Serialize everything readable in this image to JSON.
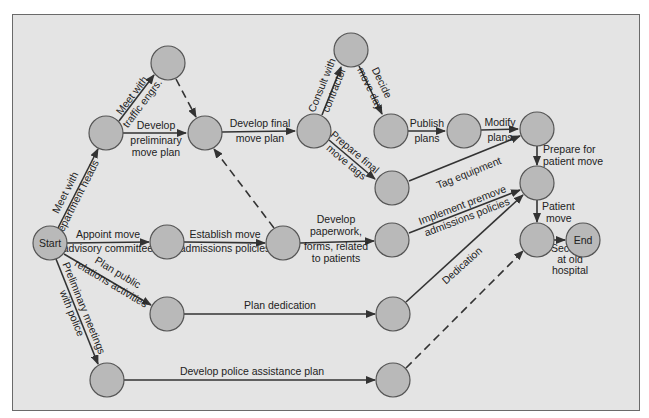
{
  "diagram": {
    "type": "activity-on-arrow network (PERT)",
    "colors": {
      "background": "#e4e4e4",
      "node_fill": "#b9b9b9",
      "node_stroke": "#555555",
      "edge": "#333333"
    },
    "nodes": [
      {
        "id": "start",
        "label": "Start",
        "x": 50,
        "y": 243
      },
      {
        "id": "n_dept",
        "label": "",
        "x": 106,
        "y": 133
      },
      {
        "id": "n_traffic",
        "label": "",
        "x": 168,
        "y": 63
      },
      {
        "id": "n_prelim",
        "label": "",
        "x": 205,
        "y": 133
      },
      {
        "id": "n_final",
        "label": "",
        "x": 314,
        "y": 131
      },
      {
        "id": "n_consult",
        "label": "",
        "x": 351,
        "y": 50
      },
      {
        "id": "n_decide",
        "label": "",
        "x": 391,
        "y": 131
      },
      {
        "id": "n_publish",
        "label": "",
        "x": 464,
        "y": 131
      },
      {
        "id": "n_modify",
        "label": "",
        "x": 537,
        "y": 129
      },
      {
        "id": "n_tags",
        "label": "",
        "x": 392,
        "y": 188
      },
      {
        "id": "n_prepare",
        "label": "",
        "x": 537,
        "y": 183
      },
      {
        "id": "n_appoint",
        "label": "",
        "x": 167,
        "y": 242
      },
      {
        "id": "n_establish",
        "label": "",
        "x": 283,
        "y": 243
      },
      {
        "id": "n_paperwork",
        "label": "",
        "x": 392,
        "y": 240
      },
      {
        "id": "n_patient",
        "label": "",
        "x": 537,
        "y": 240
      },
      {
        "id": "end",
        "label": "End",
        "x": 583,
        "y": 240
      },
      {
        "id": "n_pr",
        "label": "",
        "x": 167,
        "y": 314
      },
      {
        "id": "n_dedication",
        "label": "",
        "x": 393,
        "y": 314
      },
      {
        "id": "n_police",
        "label": "",
        "x": 107,
        "y": 380
      },
      {
        "id": "n_policeplan",
        "label": "",
        "x": 393,
        "y": 380
      }
    ],
    "edges": [
      {
        "from": "start",
        "to": "n_dept",
        "label": "Meet with department heads",
        "dashed": false
      },
      {
        "from": "n_dept",
        "to": "n_traffic",
        "label": "Meet with traffic engrs.",
        "dashed": false
      },
      {
        "from": "n_dept",
        "to": "n_prelim",
        "label": "Develop preliminary move plan",
        "dashed": false
      },
      {
        "from": "n_traffic",
        "to": "n_prelim",
        "label": "",
        "dashed": true
      },
      {
        "from": "n_prelim",
        "to": "n_final",
        "label": "Develop final move plan",
        "dashed": false
      },
      {
        "from": "n_establish",
        "to": "n_prelim",
        "label": "",
        "dashed": true
      },
      {
        "from": "n_final",
        "to": "n_consult",
        "label": "Consult with contractor",
        "dashed": false
      },
      {
        "from": "n_consult",
        "to": "n_decide",
        "label": "Decide move day",
        "dashed": false
      },
      {
        "from": "n_decide",
        "to": "n_publish",
        "label": "Publish plans",
        "dashed": false
      },
      {
        "from": "n_publish",
        "to": "n_modify",
        "label": "Modify plans",
        "dashed": false
      },
      {
        "from": "n_final",
        "to": "n_tags",
        "label": "Prepare final move tags",
        "dashed": false
      },
      {
        "from": "n_tags",
        "to": "n_modify",
        "label": "Tag equipment",
        "dashed": false
      },
      {
        "from": "n_modify",
        "to": "n_prepare",
        "label": "Prepare for patient move",
        "dashed": false
      },
      {
        "from": "n_prepare",
        "to": "n_patient",
        "label": "Patient move",
        "dashed": false
      },
      {
        "from": "n_patient",
        "to": "end",
        "label": "Security at old hospital",
        "dashed": false
      },
      {
        "from": "start",
        "to": "n_appoint",
        "label": "Appoint move advisory committee",
        "dashed": false
      },
      {
        "from": "n_appoint",
        "to": "n_establish",
        "label": "Establish move admissions policies",
        "dashed": false
      },
      {
        "from": "n_establish",
        "to": "n_paperwork",
        "label": "Develop paperwork, forms, related to patients",
        "dashed": false
      },
      {
        "from": "n_paperwork",
        "to": "n_prepare",
        "label": "Implement premove admissions policies",
        "dashed": false
      },
      {
        "from": "start",
        "to": "n_pr",
        "label": "Plan public relations activities",
        "dashed": false
      },
      {
        "from": "n_pr",
        "to": "n_dedication",
        "label": "Plan dedication",
        "dashed": false
      },
      {
        "from": "n_dedication",
        "to": "n_prepare",
        "label": "Dedication",
        "dashed": false
      },
      {
        "from": "start",
        "to": "n_police",
        "label": "Preliminary meetings with police",
        "dashed": false
      },
      {
        "from": "n_police",
        "to": "n_policeplan",
        "label": "Develop police assistance plan",
        "dashed": false
      },
      {
        "from": "n_policeplan",
        "to": "n_patient",
        "label": "",
        "dashed": true
      }
    ],
    "labels": {
      "start": "Start",
      "end": "End",
      "meet_dept_1": "Meet with",
      "meet_dept_2": "department heads",
      "meet_traffic_1": "Meet with",
      "meet_traffic_2": "traffic engrs.",
      "prelim_1": "Develop",
      "prelim_2": "preliminary",
      "prelim_3": "move plan",
      "final_1": "Develop final",
      "final_2": "move plan",
      "consult_1": "Consult with",
      "consult_2": "contractor",
      "decide_1": "Decide",
      "decide_2": "move day",
      "publish_1": "Publish",
      "publish_2": "plans",
      "modify_1": "Modify",
      "modify_2": "plans",
      "tags_1": "Prepare final",
      "tags_2": "move tags",
      "tag_equipment": "Tag equipment",
      "prepare_1": "Prepare for",
      "prepare_2": "patient move",
      "patient_1": "Patient",
      "patient_2": "move",
      "security_1": "Security",
      "security_2": "at old",
      "security_3": "hospital",
      "appoint_1": "Appoint move",
      "appoint_2": "advisory committee",
      "establish_1": "Establish move",
      "establish_2": "admissions policies",
      "paperwork_1": "Develop",
      "paperwork_2": "paperwork,",
      "paperwork_3": "forms, related",
      "paperwork_4": "to patients",
      "implement_1": "Implement premove",
      "implement_2": "admissions policies",
      "pr_1": "Plan public",
      "pr_2": "relations activities",
      "plan_dedication": "Plan dedication",
      "dedication": "Dedication",
      "police_1": "Preliminary meetings",
      "police_2": "with police",
      "police_plan": "Develop police assistance plan"
    }
  }
}
